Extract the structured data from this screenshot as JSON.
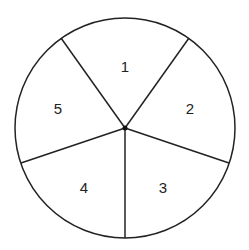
{
  "diagram": {
    "type": "spinner",
    "sector_count": 5,
    "sectors": [
      {
        "label": "1"
      },
      {
        "label": "2"
      },
      {
        "label": "3"
      },
      {
        "label": "4"
      },
      {
        "label": "5"
      }
    ],
    "colors": {
      "stroke": "#222222",
      "fill": "#ffffff"
    }
  }
}
